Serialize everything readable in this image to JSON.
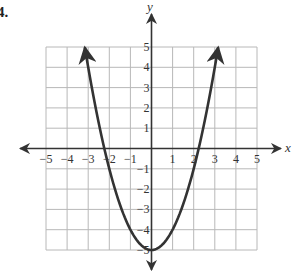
{
  "problem": {
    "label": "4."
  },
  "chart_data": {
    "type": "line",
    "title": "",
    "xlabel": "x",
    "ylabel": "y",
    "xlim": [
      -5,
      5
    ],
    "ylim": [
      -5,
      5
    ],
    "grid": true,
    "x_ticks": [
      -5,
      -4,
      -3,
      -2,
      -1,
      1,
      2,
      3,
      4,
      5
    ],
    "y_ticks": [
      5,
      4,
      3,
      2,
      1,
      -1,
      -2,
      -3,
      -4,
      -5
    ],
    "x_tick_labels": [
      "−5",
      "−4",
      "−3",
      "−2",
      "−1",
      "1",
      "2",
      "3",
      "4",
      "5"
    ],
    "y_tick_labels": [
      "5",
      "4",
      "3",
      "2",
      "1",
      "−1",
      "−2",
      "−3",
      "−4",
      "−5"
    ],
    "series": [
      {
        "name": "parabola",
        "equation": "y = x^2 - 5",
        "vertex": [
          0,
          -5
        ],
        "x_intercepts": [
          -2.24,
          2.24
        ],
        "x": [
          -3.16,
          -3,
          -2.5,
          -2,
          -1.5,
          -1,
          -0.5,
          0,
          0.5,
          1,
          1.5,
          2,
          2.5,
          3,
          3.16
        ],
        "y": [
          5,
          4,
          1.25,
          -1,
          -2.75,
          -4,
          -4.75,
          -5,
          -4.75,
          -4,
          -2.75,
          -1,
          1.25,
          4,
          5
        ],
        "arrows_at_ends": true,
        "color": "#333333"
      }
    ]
  },
  "colors": {
    "grid": "#b8b8b8",
    "axis": "#333333",
    "curve": "#333333"
  }
}
